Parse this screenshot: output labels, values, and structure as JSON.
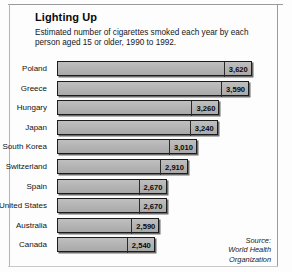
{
  "header": {
    "title": "Lighting Up",
    "subtitle": "Estimated number of cigarettes smoked each year by each person aged 15 or older, 1990 to 1992."
  },
  "source": {
    "line1": "Source:",
    "line2": "World Health",
    "line3": "Organization"
  },
  "chart_data": {
    "type": "bar",
    "orientation": "horizontal",
    "title": "Lighting Up",
    "subtitle": "Estimated number of cigarettes smoked each year by each person aged 15 or older, 1990 to 1992.",
    "xlabel": "",
    "ylabel": "",
    "grid": false,
    "legend": null,
    "axis_baseline": 1450,
    "xlim": [
      1450,
      3700
    ],
    "categories": [
      "Poland",
      "Greece",
      "Hungary",
      "Japan",
      "South Korea",
      "Switzerland",
      "Spain",
      "United States",
      "Australia",
      "Canada"
    ],
    "values": [
      3620,
      3590,
      3260,
      3240,
      3010,
      2910,
      2670,
      2670,
      2590,
      2540
    ],
    "value_labels": [
      "3,620",
      "3,590",
      "3,260",
      "3,240",
      "3,010",
      "2,910",
      "2,670",
      "2,670",
      "2,590",
      "2,540"
    ],
    "bar_color": "#b6b6b6",
    "bar_border_color": "#1c1c1c"
  }
}
